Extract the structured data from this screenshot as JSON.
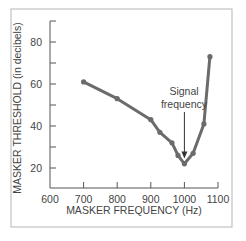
{
  "chart_data": {
    "type": "line",
    "title": "",
    "xlabel": "MASKER FREQUENCY (Hz)",
    "ylabel": "MASKER THRESHOLD (in decibels)",
    "xlim": [
      600,
      1100
    ],
    "ylim": [
      10,
      90
    ],
    "x_ticks": [
      600,
      700,
      800,
      900,
      1000,
      1100
    ],
    "y_ticks": [
      20,
      40,
      60,
      80
    ],
    "y_minor_ticks": [
      30,
      50,
      70,
      90
    ],
    "grid": false,
    "series": [
      {
        "name": "Masker threshold",
        "x": [
          700,
          800,
          900,
          927,
          963,
          981,
          1000,
          1026,
          1058,
          1076
        ],
        "values": [
          61,
          53,
          43,
          37,
          32,
          26,
          22,
          27,
          41,
          73
        ]
      }
    ],
    "annotations": [
      {
        "text_line1": "Signal",
        "text_line2": "frequency",
        "x": 1000,
        "arrow_to_y": 24
      }
    ],
    "colors": {
      "line": "#6b6b6b",
      "axis": "#555555",
      "frame": "#b5b5b5"
    }
  }
}
